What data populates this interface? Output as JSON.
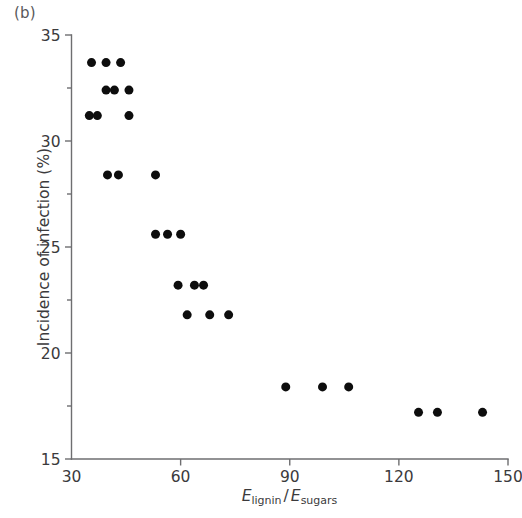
{
  "panel": {
    "label": "(b)"
  },
  "chart_data": {
    "type": "scatter",
    "title": "",
    "xlabel": "E_lignin / E_sugars",
    "xlabel_parts": {
      "e1": "E",
      "sub1": "lignin",
      "slash": "/",
      "e2": "E",
      "sub2": "sugars"
    },
    "ylabel": "Incidence of infection (%)",
    "xlim": [
      30,
      150
    ],
    "ylim": [
      15,
      35
    ],
    "xticks": [
      30,
      60,
      90,
      120,
      150
    ],
    "xtick_labels": [
      "30",
      "60",
      "90",
      "120",
      "150"
    ],
    "yticks": [
      15,
      20,
      25,
      30,
      35
    ],
    "ytick_labels": [
      "15",
      "20",
      "25",
      "30",
      "35"
    ],
    "y_minor_ticks": [
      17.5,
      22.5,
      27.5,
      32.5
    ],
    "x_minor_ticks": [],
    "grid": false,
    "legend": null,
    "marker": {
      "shape": "circle",
      "color": "#0d0d0d",
      "size_px": 9
    },
    "points": [
      {
        "x": 35.5,
        "y": 33.7
      },
      {
        "x": 39.5,
        "y": 33.7
      },
      {
        "x": 43.5,
        "y": 33.7
      },
      {
        "x": 39.5,
        "y": 32.4
      },
      {
        "x": 41.8,
        "y": 32.4
      },
      {
        "x": 45.8,
        "y": 32.4
      },
      {
        "x": 34.9,
        "y": 31.2
      },
      {
        "x": 37.1,
        "y": 31.2
      },
      {
        "x": 45.8,
        "y": 31.2
      },
      {
        "x": 39.9,
        "y": 28.4
      },
      {
        "x": 42.9,
        "y": 28.4
      },
      {
        "x": 53.1,
        "y": 28.4
      },
      {
        "x": 53.1,
        "y": 25.6
      },
      {
        "x": 56.4,
        "y": 25.6
      },
      {
        "x": 60.0,
        "y": 25.6
      },
      {
        "x": 59.3,
        "y": 23.2
      },
      {
        "x": 63.8,
        "y": 23.2
      },
      {
        "x": 66.3,
        "y": 23.2
      },
      {
        "x": 61.8,
        "y": 21.8
      },
      {
        "x": 68.0,
        "y": 21.8
      },
      {
        "x": 73.2,
        "y": 21.8
      },
      {
        "x": 88.9,
        "y": 18.4
      },
      {
        "x": 99.0,
        "y": 18.4
      },
      {
        "x": 106.2,
        "y": 18.4
      },
      {
        "x": 125.4,
        "y": 17.2
      },
      {
        "x": 130.6,
        "y": 17.2
      },
      {
        "x": 143.0,
        "y": 17.2
      }
    ]
  },
  "axis": {
    "color": "#6e6e70",
    "line_width": 1.4
  }
}
